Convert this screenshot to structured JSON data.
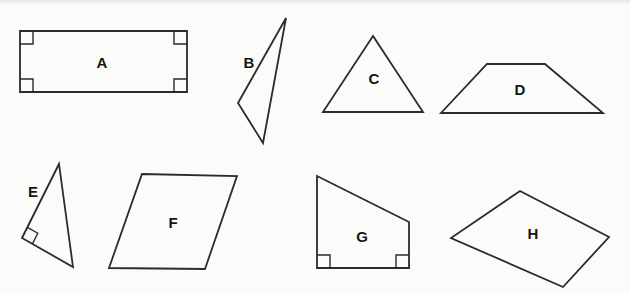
{
  "canvas": {
    "width": 630,
    "height": 294,
    "background": "#fbfbfa",
    "top_band_color": "#e3e3e1",
    "stroke_color": "#2b2b2b",
    "stroke_width": 1.8,
    "label_color": "#161616",
    "label_font_size": 15,
    "right_angle_mark_size": 13
  },
  "shapes": [
    {
      "label": "A",
      "type": "rectangle",
      "points": [
        [
          20,
          31
        ],
        [
          187,
          31
        ],
        [
          187,
          92
        ],
        [
          20,
          92
        ]
      ],
      "label_pos": [
        102,
        62
      ],
      "right_angles": [
        0,
        1,
        2,
        3
      ]
    },
    {
      "label": "B",
      "type": "scalene-triangle",
      "points": [
        [
          286,
          18
        ],
        [
          238,
          103
        ],
        [
          263,
          143
        ]
      ],
      "label_pos": [
        249,
        62
      ],
      "right_angles": []
    },
    {
      "label": "C",
      "type": "triangle",
      "points": [
        [
          373,
          36
        ],
        [
          323,
          112
        ],
        [
          423,
          112
        ]
      ],
      "label_pos": [
        374,
        78
      ],
      "right_angles": []
    },
    {
      "label": "D",
      "type": "trapezoid",
      "points": [
        [
          487,
          64
        ],
        [
          545,
          64
        ],
        [
          603,
          113
        ],
        [
          441,
          113
        ]
      ],
      "label_pos": [
        520,
        89
      ],
      "right_angles": []
    },
    {
      "label": "E",
      "type": "right-triangle",
      "points": [
        [
          59,
          164
        ],
        [
          22,
          238
        ],
        [
          73,
          267
        ]
      ],
      "label_pos": [
        33,
        191
      ],
      "right_angles": [
        1
      ],
      "mark_size": 12
    },
    {
      "label": "F",
      "type": "parallelogram",
      "points": [
        [
          142,
          174
        ],
        [
          237,
          176
        ],
        [
          205,
          269
        ],
        [
          109,
          268
        ]
      ],
      "label_pos": [
        173,
        222
      ],
      "right_angles": []
    },
    {
      "label": "G",
      "type": "right-trapezoid",
      "points": [
        [
          317,
          176
        ],
        [
          409,
          222
        ],
        [
          409,
          268
        ],
        [
          317,
          268
        ]
      ],
      "label_pos": [
        362,
        236
      ],
      "right_angles": [
        2,
        3
      ]
    },
    {
      "label": "H",
      "type": "quadrilateral",
      "points": [
        [
          520,
          191
        ],
        [
          609,
          237
        ],
        [
          563,
          287
        ],
        [
          451,
          238
        ]
      ],
      "label_pos": [
        533,
        233
      ],
      "right_angles": []
    }
  ]
}
